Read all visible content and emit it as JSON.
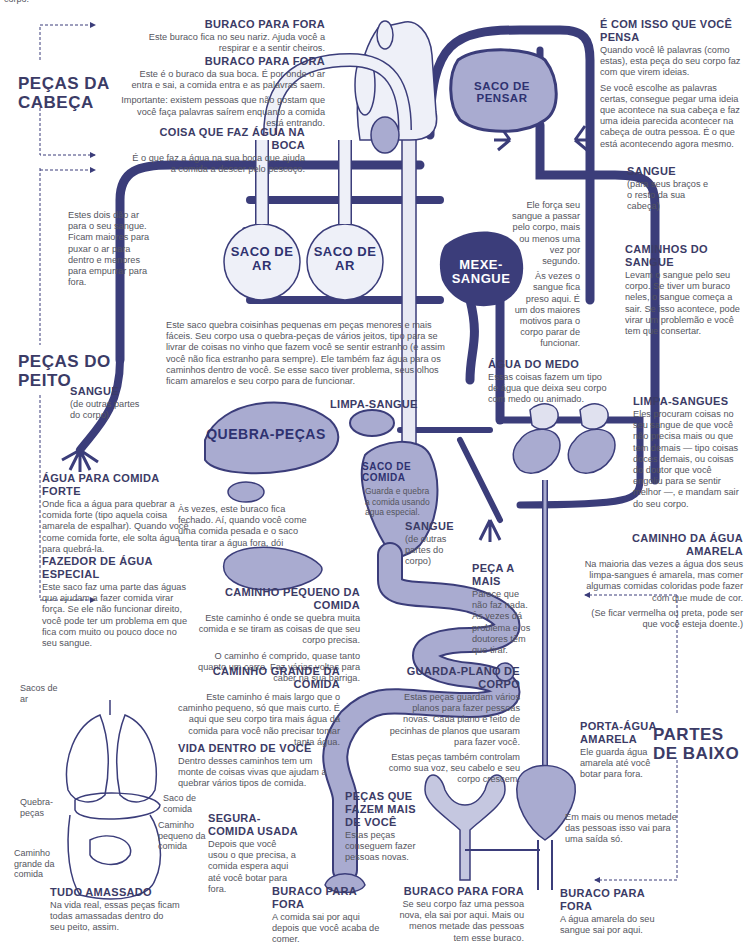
{
  "top_fragment": "corpo.",
  "sections": {
    "head": "PEÇAS DA CABEÇA",
    "chest": "PEÇAS DO PEITO",
    "lower": "PARTES DE BAIXO"
  },
  "organs": {
    "brain": "SACO DE PENSAR",
    "lung_left": "SACO DE AR",
    "lung_right": "SACO DE AR",
    "heart": "MEXE-SANGUE",
    "liver": "QUEBRA-PEÇAS",
    "stomach": "SACO DE COMIDA",
    "stomach_desc": "Guarda e quebra a comida usando água especial."
  },
  "labels": {
    "nose": {
      "title": "BURACO PARA FORA",
      "text": "Este buraco fica no seu nariz. Ajuda você a respirar e a sentir cheiros."
    },
    "mouth": {
      "title": "BURACO PARA FORA",
      "text": "Este é o buraco da sua boca. É por onde o ar entra e sai, a comida entra e as palavras saem.",
      "note": "Importante: existem pessoas que não gostam que você faça palavras saírem enquanto a comida está entrando."
    },
    "saliva": {
      "title": "COISA QUE FAZ ÁGUA NA BOCA",
      "text": "É o que faz a água na sua boca que ajuda a comida a descer pelo pescoço."
    },
    "brain": {
      "title": "É COM ISSO QUE VOCÊ PENSA",
      "text": "Quando você lê palavras (como estas), esta peça do seu corpo faz com que virem ideias.",
      "text2": "Se você escolhe as palavras certas, consegue pegar uma ideia que acontece na sua cabeça e faz uma ideia parecida acontecer na cabeça de outra pessoa. É o que está acontecendo agora mesmo."
    },
    "blood_arms": {
      "title": "SANGUE",
      "text": "(para seus braços e o resto da sua cabeça)"
    },
    "lungs": {
      "text": "Estes dois dão ar para o seu sangue. Ficam maiores para puxar o ar para dentro e menores para empurrar para fora."
    },
    "heart": {
      "text": "Ele força seu sangue a passar pelo corpo, mais ou menos uma vez por segundo.",
      "text2": "Às vezes o sangue fica preso aqui. É um dos maiores motivos para o corpo parar de funcionar."
    },
    "vessels": {
      "title": "CAMINHOS DO SANGUE",
      "text": "Levam o sangue pelo seu corpo. Se tiver um buraco neles, o sangue começa a sair. Se isso acontece, pode virar um problemão e você tem que consertar."
    },
    "liver": {
      "text": "Este saco quebra coisinhas pequenas em peças menores e mais fáceis. Seu corpo usa o quebra-peças de vários jeitos, tipo para se livrar de coisas no vinho que fazem você se sentir estranho (e assim você não fica estranho para sempre). Ele também faz água para os caminhos dentro de você. Se esse saco tiver problema, seus olhos ficam amarelos e seu corpo para de funcionar."
    },
    "adrenal": {
      "title": "ÁGUA DO MEDO",
      "text": "Essas coisas fazem um tipo de água que deixa seu corpo com medo ou animado."
    },
    "spleen": {
      "title": "LIMPA-SANGUE"
    },
    "blood_lower": {
      "title": "SANGUE",
      "text": "(de outras partes do corpo)"
    },
    "kidneys": {
      "title": "LIMPA-SANGUES",
      "text": "Eles procuram coisas no seu sangue de que você não precisa mais ou que tem demais — tipo coisas doces demais, ou coisas do doutor que você engoliu para se sentir melhor —, e mandam sair do seu corpo."
    },
    "gallbladder": {
      "title": "ÁGUA PARA COMIDA FORTE",
      "text": "Onde fica a água para quebrar a comida forte (tipo aquela coisa amarela de espalhar). Quando você come comida forte, ele solta água para quebrá-la."
    },
    "gallbladder_note": {
      "text": "Às vezes, este buraco fica fechado. Aí, quando você come uma comida pesada e o saco tenta tirar a água fora, dói"
    },
    "blood_stomach": {
      "title": "SANGUE",
      "text": "(de outras partes do corpo)"
    },
    "pancreas": {
      "title": "FAZEDOR DE ÁGUA ESPECIAL",
      "text": "Este saco faz uma parte das águas que ajudam a fazer comida virar força. Se ele não funcionar direito, você pode ter um problema em que fica com muito ou pouco doce no seu sangue."
    },
    "ureter": {
      "title": "CAMINHO DA ÁGUA AMARELA",
      "text": "Na maioria das vezes a água dos seus limpa-sangues é amarela, mas comer algumas comidas coloridas pode fazer com que mude de cor.",
      "text2": "(Se ficar vermelha ou preta, pode ser que você esteja doente.)"
    },
    "small_intestine": {
      "title": "CAMINHO PEQUENO DA COMIDA",
      "text": "Este caminho é onde se quebra muita comida e se tiram as coisas de que seu corpo precisa.",
      "text2": "O caminho é comprido, quase tanto quanto um carro. Faz várias voltas para caber na sua barriga."
    },
    "appendix": {
      "title": "PEÇA A MAIS",
      "text": "Parece que não faz nada. Às vezes dá problema e os doutores têm que tirar."
    },
    "large_intestine": {
      "title": "CAMINHO GRANDE DA COMIDA",
      "text": "Este caminho é mais largo que o caminho pequeno, só que mais curto. É aqui que seu corpo tira mais água da comida para você não precisar tomar tanta água."
    },
    "ovaries": {
      "title": "GUARDA-PLANO DE CORPO",
      "text": "Estas peças guardam vários planos para fazer pessoas novas. Cada plano é feito de pecinhas de planos que usaram para fazer você.",
      "text2": "Estas peças também controlam como sua voz, seu cabelo e seu corpo crescem."
    },
    "gut_flora": {
      "title": "VIDA DENTRO DE VOCÊ",
      "text": "Dentro desses caminhos tem um monte de coisas vivas que ajudam a quebrar vários tipos de comida."
    },
    "bladder": {
      "title": "PORTA-ÁGUA AMARELA",
      "text": "Ele guarda água amarela até você botar para fora."
    },
    "uterus": {
      "title": "PEÇAS QUE FAZEM MAIS DE VOCÊ",
      "text": "Estas peças conseguem fazer pessoas novas."
    },
    "rectum": {
      "title": "SEGURA-COMIDA USADA",
      "text": "Depois que você usou o que precisa, a comida espera aqui até você botar para fora."
    },
    "urethra_note": {
      "text": "Em mais ou menos metade das pessoas isso vai para uma saída só."
    },
    "anus": {
      "title": "BURACO PARA FORA",
      "text": "A comida sai por aqui depois que você acaba de comer."
    },
    "vagina": {
      "title": "BURACO PARA FORA",
      "text": "Se seu corpo faz uma pessoa nova, ela sai por aqui. Mais ou menos metade das pessoas tem esse buraco."
    },
    "urethra": {
      "title": "BURACO PARA FORA",
      "text": "A água amarela do seu sangue sai por aqui."
    }
  },
  "inset": {
    "title": "TUDO AMASSADO",
    "text": "Na vida real, essas peças ficam todas amassadas dentro do seu peito, assim.",
    "callouts": [
      "Sacos de ar",
      "Quebra-peças",
      "Caminho grande da comida",
      "Saco de comida",
      "Caminho pequeno da comida"
    ]
  },
  "colors": {
    "vessel": "#3b3d7a",
    "organ_fill": "#a9abd0",
    "organ_light": "#e8e9f4",
    "text_heading": "#3b3b66",
    "text_body": "#55555e"
  }
}
